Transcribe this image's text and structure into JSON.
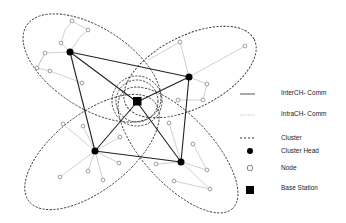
{
  "diagram": {
    "type": "wsn-cluster-topology",
    "colors": {
      "inter_ch": "#222222",
      "intra_ch": "#bbbbbb",
      "cluster_boundary": "#333333",
      "node_stroke": "#888888",
      "cluster_head": "#000000",
      "base_station": "#000000"
    },
    "base_station": {
      "x": 137,
      "y": 102
    },
    "cluster_heads": [
      {
        "id": "CH1",
        "x": 70,
        "y": 52
      },
      {
        "id": "CH2",
        "x": 189,
        "y": 77
      },
      {
        "id": "CH3",
        "x": 95,
        "y": 151
      },
      {
        "id": "CH4",
        "x": 181,
        "y": 162
      }
    ],
    "legend": {
      "items": [
        {
          "symbol": "solid-line",
          "label": "InterCH- Comm"
        },
        {
          "symbol": "dotted-line",
          "label": "IntraCH- Comm"
        },
        {
          "symbol": "dashed-line",
          "label": "Cluster"
        },
        {
          "symbol": "filled-circle",
          "label": "Cluster Head"
        },
        {
          "symbol": "hollow-circle",
          "label": "Node"
        },
        {
          "symbol": "filled-square",
          "label": "Base Station"
        }
      ]
    }
  }
}
